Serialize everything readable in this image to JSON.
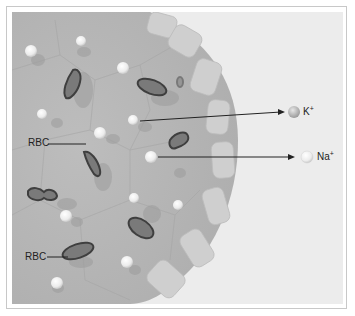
{
  "figure": {
    "colors": {
      "background": "#ffffff",
      "panel": "#ececec",
      "cell_body": "#b9b9b9",
      "membrane_blocks": "#cfcfcf",
      "rbc_ring": "#4a4a4a",
      "ion": "#f4f4f4",
      "arrow": "#222222"
    }
  },
  "labels": {
    "rbc_top": "RBC",
    "rbc_bottom": "RBC",
    "potassium": {
      "symbol": "K",
      "charge": "+"
    },
    "sodium": {
      "symbol": "Na",
      "charge": "+"
    }
  },
  "icons": {
    "potassium_ion": "sphere-gray",
    "sodium_ion": "sphere-white"
  }
}
